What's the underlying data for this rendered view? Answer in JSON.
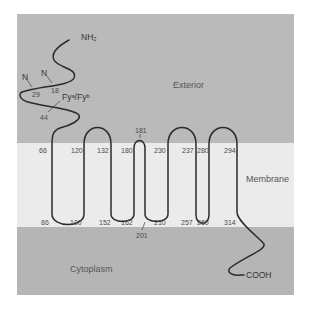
{
  "diagram": {
    "colors": {
      "exterior": "#b9b9b9",
      "membrane": "#e9e9e9",
      "cytoplasm": "#b4b4b4",
      "chain": "#2b2b2b"
    },
    "regions": {
      "exterior": "Exterior",
      "membrane": "Membrane",
      "cytoplasm": "Cytoplasm"
    },
    "termini": {
      "n_terminus": "NH₂",
      "c_terminus": "COOH"
    },
    "glycosylation_sites": [
      {
        "label": "N",
        "residue": "29"
      },
      {
        "label": "N",
        "residue": "18"
      }
    ],
    "antigen_site": {
      "label": "Fyᵃ/Fyᵇ",
      "residue": "44"
    },
    "top_boundary_residues": [
      "66",
      "120",
      "132",
      "180",
      "230",
      "237",
      "280",
      "294"
    ],
    "bottom_boundary_residues": [
      "86",
      "100",
      "152",
      "162",
      "210",
      "257",
      "260",
      "314"
    ],
    "loop_residues": {
      "top_small_loop": "181",
      "bottom_small_loop": "201"
    }
  }
}
